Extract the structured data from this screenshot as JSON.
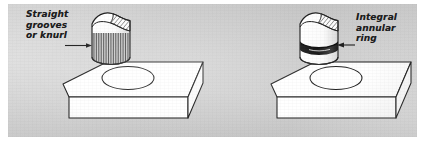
{
  "figure": {
    "name": "technical-illustration-two-assembly-details",
    "background_color": "#cfcfcf",
    "ink_color": "#1c1c1c",
    "paper_margin_color": "#ffffff"
  },
  "panels": [
    {
      "id": "left",
      "label_lines": [
        "Straight",
        "grooves",
        "or knurl"
      ],
      "leader": "arrow-pointing-right-to-cylinder-knurl",
      "part": {
        "name": "cylindrical-pin-with-straight-knurl",
        "feature": "vertical-groove-band",
        "top_cut": "sectioned-scoop-with-diagonal-hatch",
        "hatch_lines": 22
      },
      "base": {
        "name": "flat-plate-with-round-hole",
        "hole": "ellipse"
      }
    },
    {
      "id": "right",
      "label_lines": [
        "Integral",
        "annular",
        "ring"
      ],
      "leader": "arrow-pointing-left-to-cylinder-ring",
      "part": {
        "name": "cylindrical-pin-with-annular-ring",
        "feature": "solid-black-annular-band",
        "top_cut": "sectioned-scoop-with-diagonal-hatch",
        "hatch_lines": 9
      },
      "base": {
        "name": "flat-plate-with-round-hole",
        "hole": "ellipse"
      }
    }
  ]
}
